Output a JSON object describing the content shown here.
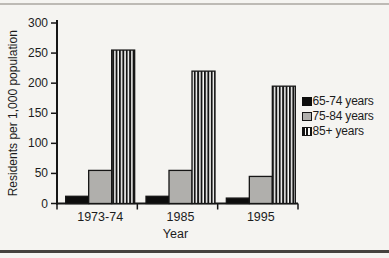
{
  "page": {
    "kind": "scanned-book-figure"
  },
  "chart_data": {
    "type": "bar",
    "title": "",
    "categories": [
      "1973-74",
      "1985",
      "1995"
    ],
    "series": [
      {
        "name": "65-74 years",
        "style": "solid-black",
        "values": [
          12,
          12,
          9
        ]
      },
      {
        "name": "75-84 years",
        "style": "solid-gray",
        "values": [
          55,
          55,
          45
        ]
      },
      {
        "name": "85+ years",
        "style": "striped-vertical",
        "values": [
          255,
          220,
          195
        ]
      }
    ],
    "xlabel": "Year",
    "ylabel": "Residents per 1,000 population",
    "ylim": [
      0,
      300
    ],
    "ytick_step": 50,
    "yticks": [
      0,
      50,
      100,
      150,
      200,
      250,
      300
    ],
    "grid": false,
    "legend_position": "right",
    "colors": {
      "black_series": "#0d0d0d",
      "gray_series": "#b0afac",
      "stripe_dark": "#141414",
      "stripe_light": "#fcfcfa",
      "axis": "#161616",
      "text": "#1c1c1c",
      "paper": "#f5f4f1",
      "top_rule": "#bdbab5",
      "bottom_rule": "#45423e"
    }
  }
}
